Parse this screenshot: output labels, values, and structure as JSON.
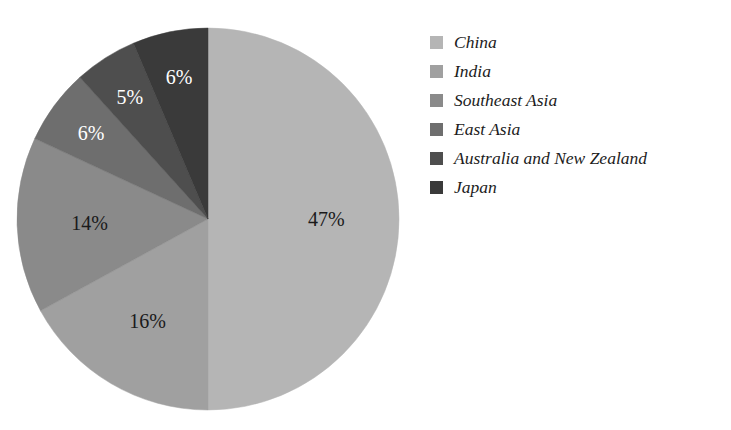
{
  "chart_data": {
    "type": "pie",
    "title": "",
    "subtitle": "",
    "xlabel": "",
    "ylabel": "",
    "legend_position": "right",
    "grid": false,
    "categories": [
      "China",
      "India",
      "Southeast Asia",
      "East Asia",
      "Australia and New Zealand",
      "Japan"
    ],
    "values": [
      47,
      16,
      14,
      6,
      5,
      6
    ],
    "value_labels": [
      "47%",
      "16%",
      "14%",
      "6%",
      "5%",
      "6%"
    ],
    "colors": [
      "#b5b5b5",
      "#a0a0a0",
      "#8a8a8a",
      "#6e6e6e",
      "#4e4e4e",
      "#3a3a3a"
    ],
    "label_text_colors": [
      "#1a1a1a",
      "#1a1a1a",
      "#1a1a1a",
      "#ffffff",
      "#ffffff",
      "#ffffff"
    ],
    "start_angle_deg": 0,
    "direction": "clockwise",
    "slices": [
      {
        "name": "China",
        "value": 47,
        "label": "47%",
        "color": "#b5b5b5",
        "label_color": "dark"
      },
      {
        "name": "India",
        "value": 16,
        "label": "16%",
        "color": "#a0a0a0",
        "label_color": "dark"
      },
      {
        "name": "Southeast Asia",
        "value": 14,
        "label": "14%",
        "color": "#8a8a8a",
        "label_color": "dark"
      },
      {
        "name": "East Asia",
        "value": 6,
        "label": "6%",
        "color": "#6e6e6e",
        "label_color": "light"
      },
      {
        "name": "Australia and New Zealand",
        "value": 5,
        "label": "5%",
        "color": "#4e4e4e",
        "label_color": "light"
      },
      {
        "name": "Japan",
        "value": 6,
        "label": "6%",
        "color": "#3a3a3a",
        "label_color": "light"
      }
    ]
  },
  "legend": {
    "items": [
      {
        "label": "China",
        "color": "#b5b5b5"
      },
      {
        "label": "India",
        "color": "#a0a0a0"
      },
      {
        "label": "Southeast Asia",
        "color": "#8a8a8a"
      },
      {
        "label": "East Asia",
        "color": "#6e6e6e"
      },
      {
        "label": "Australia and New Zealand",
        "color": "#4e4e4e"
      },
      {
        "label": "Japan",
        "color": "#3a3a3a"
      }
    ]
  },
  "geometry": {
    "center_x": 208,
    "center_y": 219,
    "radius": 191
  }
}
